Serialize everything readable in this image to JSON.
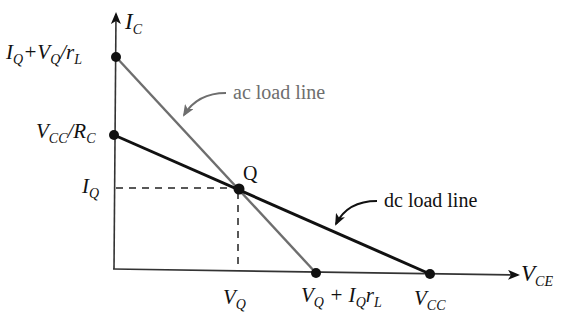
{
  "diagram": {
    "axes": {
      "y_label": "I",
      "y_label_sub": "C",
      "x_label": "V",
      "x_label_sub": "CE"
    },
    "y_ticks": [
      {
        "id": "ac_intercept",
        "parts": [
          "I",
          "Q",
          "+V",
          "Q",
          "/r",
          "L"
        ]
      },
      {
        "id": "dc_intercept",
        "parts": [
          "V",
          "CC",
          "/R",
          "C"
        ]
      },
      {
        "id": "iq",
        "parts": [
          "I",
          "Q"
        ]
      }
    ],
    "x_ticks": [
      {
        "id": "vq",
        "parts": [
          "V",
          "Q"
        ]
      },
      {
        "id": "ac_x_intercept",
        "parts": [
          "V",
          "Q",
          " + I",
          "Q",
          "r",
          "L"
        ]
      },
      {
        "id": "vcc",
        "parts": [
          "V",
          "CC"
        ]
      }
    ],
    "q_point_label": "Q",
    "annotations": {
      "ac": "ac load line",
      "dc": "dc load line"
    },
    "colors": {
      "dc_line": "#111111",
      "ac_line": "#6e6e6e",
      "annotation_ac": "#6e6e6e",
      "annotation_dc": "#111111",
      "axes": "#333333"
    },
    "points": {
      "origin": [
        113,
        269
      ],
      "ac_y_intercept": [
        116,
        57
      ],
      "dc_y_intercept": [
        114,
        135
      ],
      "q": [
        239,
        189
      ],
      "ac_x_intercept": [
        316,
        273
      ],
      "dc_x_intercept": [
        430,
        274
      ]
    }
  }
}
